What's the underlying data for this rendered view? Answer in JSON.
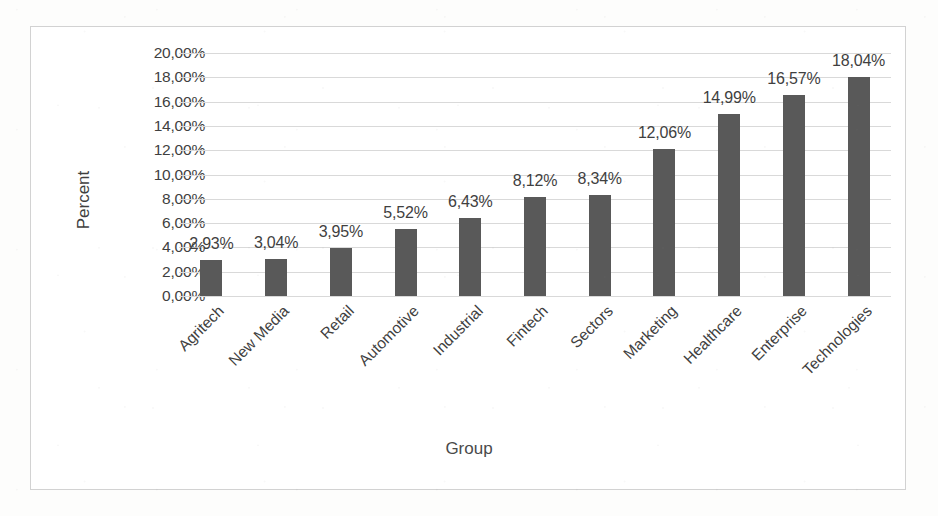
{
  "chart_data": {
    "type": "bar",
    "title": "",
    "xlabel": "Group",
    "ylabel": "Percent",
    "categories": [
      "Agritech",
      "New Media",
      "Retail",
      "Automotive",
      "Industrial",
      "Fintech",
      "Sectors",
      "Marketing",
      "Healthcare",
      "Enterprise",
      "Technologies"
    ],
    "values": [
      2.93,
      3.04,
      3.95,
      5.52,
      6.43,
      8.12,
      8.34,
      12.06,
      14.99,
      16.57,
      18.04
    ],
    "data_labels": [
      "2,93%",
      "3,04%",
      "3,95%",
      "5,52%",
      "6,43%",
      "8,12%",
      "8,34%",
      "12,06%",
      "14,99%",
      "16,57%",
      "18,04%"
    ],
    "ylim": [
      0,
      20
    ],
    "ytick_values": [
      20,
      18,
      16,
      14,
      12,
      10,
      8,
      6,
      4,
      2,
      0
    ],
    "ytick_labels": [
      "20,00%",
      "18,00%",
      "16,00%",
      "14,00%",
      "12,00%",
      "10,00%",
      "8,00%",
      "6,00%",
      "4,00%",
      "2,00%",
      "0,00%"
    ],
    "grid": true,
    "legend": "none",
    "bar_color": "#595959",
    "gridline_color": "#d9d9d9",
    "text_color": "#3f3f3f",
    "frame_color": "#d2d2d2",
    "value_suffix": "%",
    "decimal_separator": ","
  }
}
